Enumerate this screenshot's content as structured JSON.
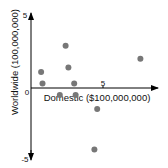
{
  "chart_data": {
    "type": "scatter",
    "title": "",
    "xlabel": "Domestic ($100,000,000)",
    "ylabel": "Worldwide (100,000,000)",
    "x_ticks": [
      "0",
      "5"
    ],
    "y_ticks": [
      "5",
      "0",
      "-5"
    ],
    "xlim": [
      0,
      8.7
    ],
    "ylim": [
      -5,
      5
    ],
    "grid": false,
    "legend": null,
    "marker_color": "#777777",
    "points": [
      {
        "x": 2.4,
        "y": 2.9
      },
      {
        "x": 2.6,
        "y": 1.4
      },
      {
        "x": 0.7,
        "y": 1.1
      },
      {
        "x": 0.8,
        "y": 0.3
      },
      {
        "x": 3.0,
        "y": 0.3
      },
      {
        "x": 2.0,
        "y": -0.5
      },
      {
        "x": 3.1,
        "y": -0.5
      },
      {
        "x": 4.6,
        "y": -1.5
      },
      {
        "x": 4.4,
        "y": -4.4
      },
      {
        "x": 7.6,
        "y": 2.0
      }
    ]
  }
}
